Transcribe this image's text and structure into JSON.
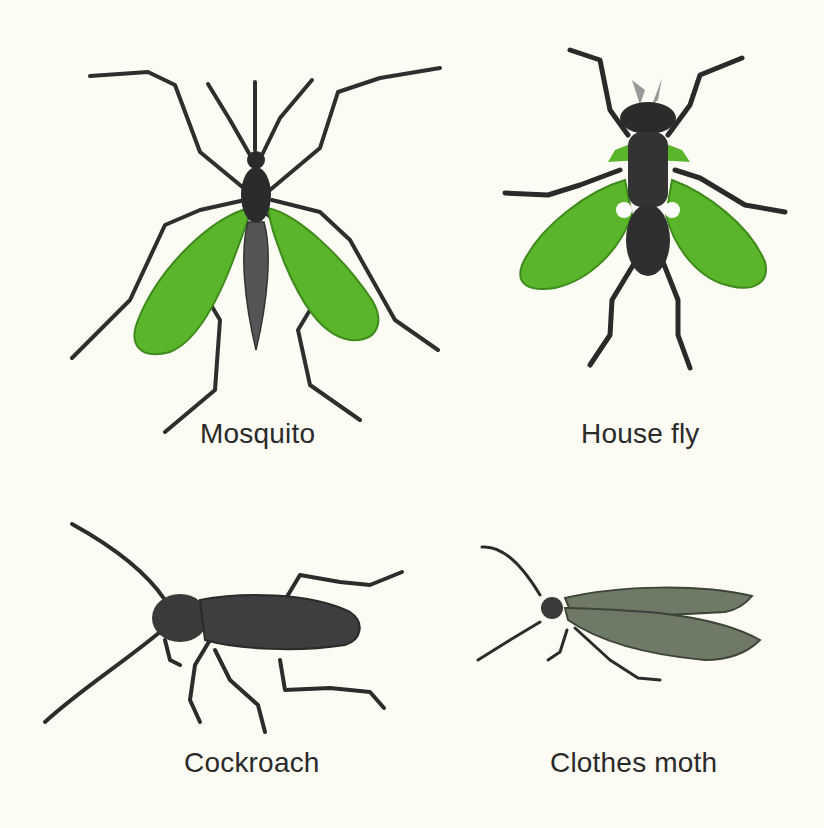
{
  "page": {
    "background": "#fdfcf4",
    "colors": {
      "wing_green": "#5bb52a",
      "wing_green_dark": "#3e8a1c",
      "body_dark": "#2b2b2b",
      "moth_wing": "#6f7a66",
      "caption": "#2a2a2a"
    }
  },
  "insects": [
    {
      "id": "mosquito",
      "caption": "Mosquito",
      "icon": "mosquito-illustration"
    },
    {
      "id": "house-fly",
      "caption": "House fly",
      "icon": "house-fly-illustration"
    },
    {
      "id": "cockroach",
      "caption": "Cockroach",
      "icon": "cockroach-illustration"
    },
    {
      "id": "clothes-moth",
      "caption": "Clothes moth",
      "icon": "clothes-moth-illustration"
    }
  ]
}
